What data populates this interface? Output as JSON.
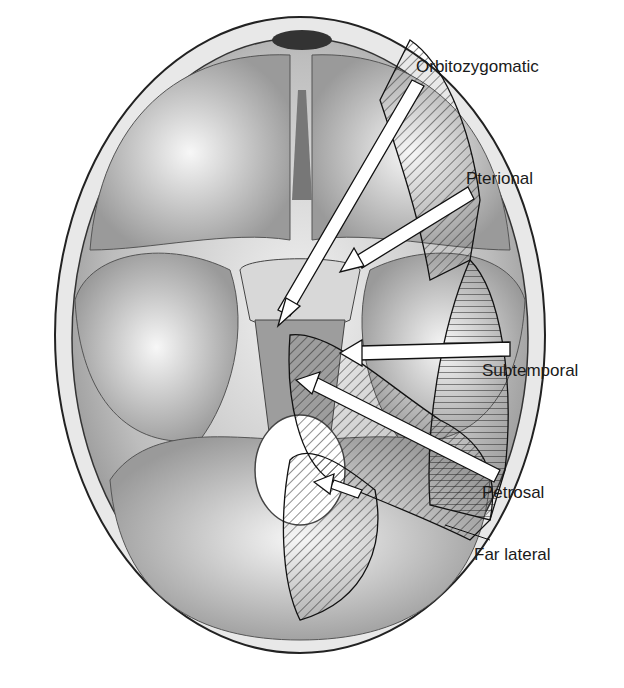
{
  "figure": {
    "labels": {
      "orbitozygomatic": "Orbitozygomatic",
      "pterional": "Pterional",
      "subtemporal": "Subtemporal",
      "petrosal": "Petrosal",
      "far_lateral": "Far lateral"
    }
  }
}
